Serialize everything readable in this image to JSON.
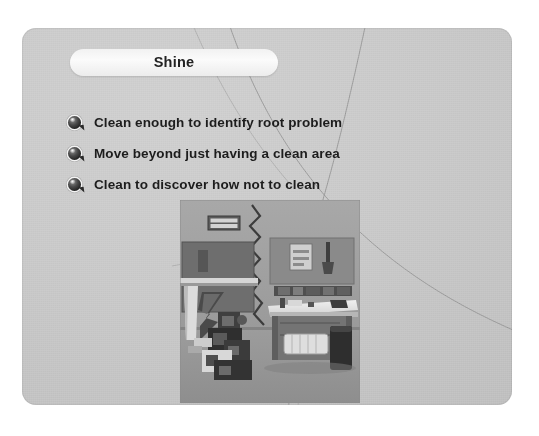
{
  "slide": {
    "title": "Shine",
    "bullets": [
      {
        "marker": "glossy-sphere-bullet",
        "text": "Clean enough to identify root problem"
      },
      {
        "marker": "glossy-sphere-bullet",
        "text": "Move beyond just having a clean area"
      },
      {
        "marker": "glossy-sphere-bullet",
        "text": "Clean to discover how not to clean"
      }
    ],
    "photo": {
      "alt": "Black and white workplace photo split by a jagged line: cluttered red tag area on the left, organized clean workbench on the right",
      "sign_line1": "RED TAG",
      "sign_line2": "AREA"
    },
    "colors": {
      "page_background": "#ffffff",
      "slide_background": "#c8c8c8",
      "title_pill": "#f6f6f6",
      "title_text": "#232323",
      "bullet_text": "#1d1d1d",
      "bullet_ball": "#1e1e1e",
      "curve_line": "#8d8d8d",
      "sign_background": "#5c5c5c"
    }
  }
}
